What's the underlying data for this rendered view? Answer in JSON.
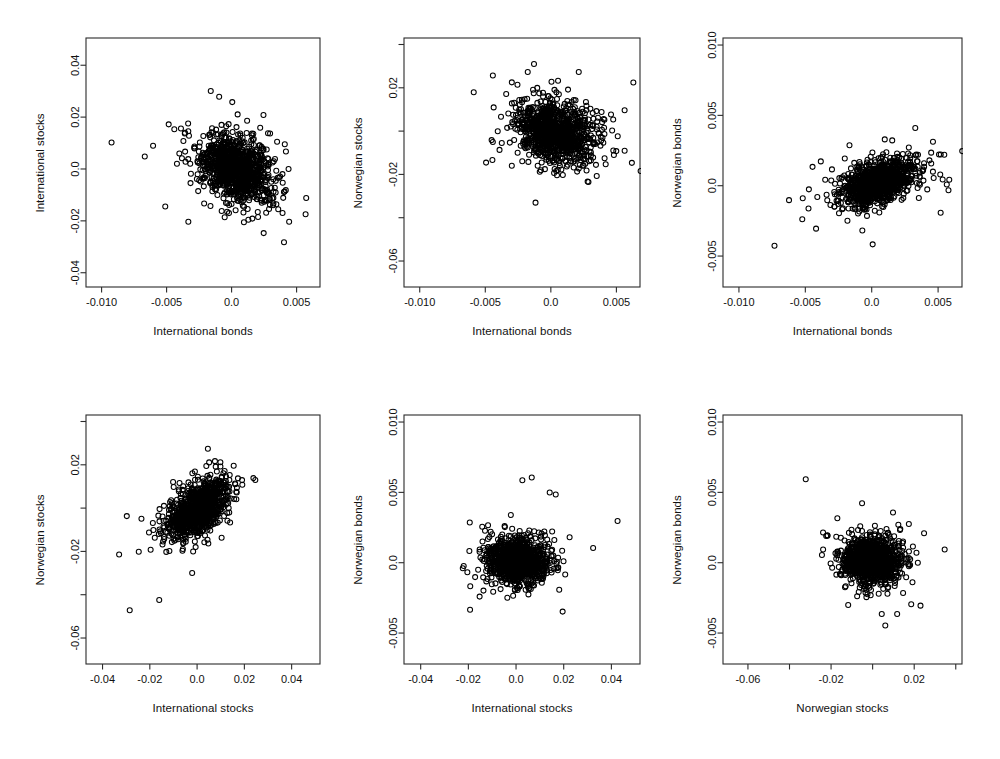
{
  "figure": {
    "kind": "scatterplot-matrix",
    "rows": 2,
    "cols": 3,
    "background": "#ffffff",
    "point_color": "#000000",
    "point_symbol": "open-circle",
    "axis_color": "#2b2b2b"
  },
  "chart_data": [
    {
      "type": "scatter",
      "title": "",
      "xlabel": "International bonds",
      "ylabel": "International stocks",
      "xlim": [
        -0.0112,
        0.0068
      ],
      "ylim": [
        -0.0455,
        0.0505
      ],
      "xticks": [
        -0.01,
        -0.005,
        0.0,
        0.005
      ],
      "xticklabels": [
        "-0.010",
        "-0.005",
        "0.0",
        "0.005"
      ],
      "yticks": [
        -0.04,
        -0.02,
        0.0,
        0.02,
        0.04
      ],
      "yticklabels": [
        "-0.04",
        "-0.02",
        "0.0",
        "0.02",
        "0.04"
      ],
      "grid": false,
      "n_points": 1050,
      "correlation": -0.3,
      "x_sd": 0.00215,
      "y_sd": 0.0098,
      "x_mean": 0.0004,
      "y_mean": 0.0002,
      "seed": 11
    },
    {
      "type": "scatter",
      "title": "",
      "xlabel": "International bonds",
      "ylabel": "Norwegian stocks",
      "xlim": [
        -0.0112,
        0.0068
      ],
      "ylim": [
        -0.072,
        0.043
      ],
      "xticks": [
        -0.01,
        -0.005,
        0.0,
        0.005
      ],
      "xticklabels": [
        "-0.010",
        "-0.005",
        "0.0",
        "0.005"
      ],
      "yticks": [
        -0.06,
        -0.04,
        -0.02,
        0.0,
        0.02,
        0.04
      ],
      "yticklabels": [
        "-0.06",
        "",
        "-0.02",
        "",
        "0.02",
        ""
      ],
      "grid": false,
      "n_points": 1050,
      "correlation": -0.18,
      "x_sd": 0.00215,
      "y_sd": 0.0105,
      "x_mean": 0.0004,
      "y_mean": -0.0003,
      "seed": 23
    },
    {
      "type": "scatter",
      "title": "",
      "xlabel": "International bonds",
      "ylabel": "Norwegian bonds",
      "xlim": [
        -0.0112,
        0.0068
      ],
      "ylim": [
        -0.0072,
        0.0105
      ],
      "xticks": [
        -0.01,
        -0.005,
        0.0,
        0.005
      ],
      "xticklabels": [
        "-0.010",
        "-0.005",
        "0.0",
        "0.005"
      ],
      "yticks": [
        -0.005,
        0.0,
        0.005,
        0.01
      ],
      "yticklabels": [
        "-0.005",
        "0.0",
        "0.005",
        "0.010"
      ],
      "grid": false,
      "n_points": 1050,
      "correlation": 0.44,
      "x_sd": 0.00215,
      "y_sd": 0.00125,
      "x_mean": 0.0004,
      "y_mean": 0.0002,
      "seed": 37
    },
    {
      "type": "scatter",
      "title": "",
      "xlabel": "International stocks",
      "ylabel": "Norwegian stocks",
      "xlim": [
        -0.047,
        0.052
      ],
      "ylim": [
        -0.072,
        0.043
      ],
      "xticks": [
        -0.04,
        -0.02,
        0.0,
        0.02,
        0.04
      ],
      "xticklabels": [
        "-0.04",
        "-0.02",
        "0.0",
        "0.02",
        "0.04"
      ],
      "yticks": [
        -0.06,
        -0.04,
        -0.02,
        0.0,
        0.02,
        0.04
      ],
      "yticklabels": [
        "-0.06",
        "",
        "-0.02",
        "",
        "0.02",
        ""
      ],
      "grid": false,
      "n_points": 1050,
      "correlation": 0.62,
      "x_sd": 0.0098,
      "y_sd": 0.0105,
      "x_mean": 0.0003,
      "y_mean": -0.0002,
      "seed": 51
    },
    {
      "type": "scatter",
      "title": "",
      "xlabel": "International stocks",
      "ylabel": "Norwegian bonds",
      "xlim": [
        -0.047,
        0.052
      ],
      "ylim": [
        -0.0072,
        0.0105
      ],
      "xticks": [
        -0.04,
        -0.02,
        0.0,
        0.02,
        0.04
      ],
      "xticklabels": [
        "-0.04",
        "-0.02",
        "0.0",
        "0.02",
        "0.04"
      ],
      "yticks": [
        -0.005,
        0.0,
        0.005,
        0.01
      ],
      "yticklabels": [
        "-0.005",
        "0.0",
        "0.005",
        "0.010"
      ],
      "grid": false,
      "n_points": 1050,
      "correlation": -0.05,
      "x_sd": 0.0098,
      "y_sd": 0.00125,
      "x_mean": 0.0003,
      "y_mean": 0.0002,
      "seed": 67
    },
    {
      "type": "scatter",
      "title": "",
      "xlabel": "Norwegian stocks",
      "ylabel": "Norwegian bonds",
      "xlim": [
        -0.072,
        0.043
      ],
      "ylim": [
        -0.0072,
        0.0105
      ],
      "xticks": [
        -0.06,
        -0.04,
        -0.02,
        0.0,
        0.02,
        0.04
      ],
      "xticklabels": [
        "-0.06",
        "",
        "-0.02",
        "",
        "0.02",
        ""
      ],
      "yticks": [
        -0.005,
        0.0,
        0.005,
        0.01
      ],
      "yticklabels": [
        "-0.005",
        "0.0",
        "0.005",
        "0.010"
      ],
      "grid": false,
      "n_points": 1050,
      "correlation": -0.02,
      "x_sd": 0.0105,
      "y_sd": 0.00125,
      "x_mean": -0.0002,
      "y_mean": 0.0002,
      "seed": 83
    }
  ],
  "layout": {
    "panels": [
      {
        "box_left": 86,
        "box_top": 38,
        "box_width": 234,
        "box_height": 249
      },
      {
        "box_left": 404,
        "box_top": 38,
        "box_width": 236,
        "box_height": 249
      },
      {
        "box_left": 723,
        "box_top": 38,
        "box_width": 239,
        "box_height": 249
      }
    ],
    "row_tops": [
      0,
      377
    ]
  }
}
